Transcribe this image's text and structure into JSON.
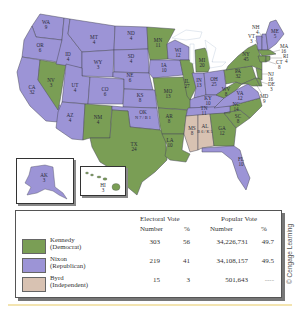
{
  "colors": {
    "kennedy": "#7a9e55",
    "nixon": "#9c94d6",
    "byrd": "#d8c2b2",
    "border": "#4a4a5a",
    "water": "#ffffff"
  },
  "states": {
    "WA": {
      "abbr": "WA",
      "ev": "9",
      "party": "nixon"
    },
    "OR": {
      "abbr": "OR",
      "ev": "6",
      "party": "nixon"
    },
    "CA": {
      "abbr": "CA",
      "ev": "32",
      "party": "nixon"
    },
    "NV": {
      "abbr": "NV",
      "ev": "3",
      "party": "kennedy"
    },
    "ID": {
      "abbr": "ID",
      "ev": "4",
      "party": "nixon"
    },
    "MT": {
      "abbr": "MT",
      "ev": "4",
      "party": "nixon"
    },
    "WY": {
      "abbr": "WY",
      "ev": "3",
      "party": "nixon"
    },
    "UT": {
      "abbr": "UT",
      "ev": "4",
      "party": "nixon"
    },
    "CO": {
      "abbr": "CO",
      "ev": "6",
      "party": "nixon"
    },
    "AZ": {
      "abbr": "AZ",
      "ev": "4",
      "party": "nixon"
    },
    "NM": {
      "abbr": "NM",
      "ev": "4",
      "party": "kennedy"
    },
    "ND": {
      "abbr": "ND",
      "ev": "4",
      "party": "nixon"
    },
    "SD": {
      "abbr": "SD",
      "ev": "4",
      "party": "nixon"
    },
    "NE": {
      "abbr": "NE",
      "ev": "6",
      "party": "nixon"
    },
    "KS": {
      "abbr": "KS",
      "ev": "8",
      "party": "nixon"
    },
    "OK": {
      "abbr": "OK",
      "ev": "N 7 / B 1",
      "party": "nixon"
    },
    "TX": {
      "abbr": "TX",
      "ev": "24",
      "party": "kennedy"
    },
    "MN": {
      "abbr": "MN",
      "ev": "11",
      "party": "kennedy"
    },
    "IA": {
      "abbr": "IA",
      "ev": "10",
      "party": "nixon"
    },
    "MO": {
      "abbr": "MO",
      "ev": "13",
      "party": "kennedy"
    },
    "AR": {
      "abbr": "AR",
      "ev": "8",
      "party": "kennedy"
    },
    "LA": {
      "abbr": "LA",
      "ev": "10",
      "party": "kennedy"
    },
    "WI": {
      "abbr": "WI",
      "ev": "12",
      "party": "nixon"
    },
    "IL": {
      "abbr": "IL",
      "ev": "27",
      "party": "kennedy"
    },
    "MI": {
      "abbr": "MI",
      "ev": "20",
      "party": "kennedy"
    },
    "IN": {
      "abbr": "IN",
      "ev": "13",
      "party": "nixon"
    },
    "OH": {
      "abbr": "OH",
      "ev": "25",
      "party": "nixon"
    },
    "KY": {
      "abbr": "KY",
      "ev": "10",
      "party": "nixon"
    },
    "TN": {
      "abbr": "TN",
      "ev": "11",
      "party": "nixon"
    },
    "MS": {
      "abbr": "MS",
      "ev": "8",
      "party": "byrd"
    },
    "AL": {
      "abbr": "AL",
      "ev": "B 6 / K 5",
      "party": "byrd"
    },
    "GA": {
      "abbr": "GA",
      "ev": "12",
      "party": "kennedy"
    },
    "FL": {
      "abbr": "FL",
      "ev": "10",
      "party": "nixon"
    },
    "SC": {
      "abbr": "SC",
      "ev": "8",
      "party": "kennedy"
    },
    "NC": {
      "abbr": "NC",
      "ev": "14",
      "party": "kennedy"
    },
    "VA": {
      "abbr": "VA",
      "ev": "12",
      "party": "nixon"
    },
    "WV": {
      "abbr": "WV",
      "ev": "8",
      "party": "kennedy"
    },
    "PA": {
      "abbr": "PA",
      "ev": "32",
      "party": "kennedy"
    },
    "NY": {
      "abbr": "NY",
      "ev": "45",
      "party": "kennedy"
    },
    "ME": {
      "abbr": "ME",
      "ev": "5",
      "party": "nixon"
    },
    "NH": {
      "abbr": "NH",
      "ev": "4",
      "party": "nixon"
    },
    "VT": {
      "abbr": "VT",
      "ev": "3",
      "party": "nixon"
    },
    "MA": {
      "abbr": "MA",
      "ev": "16",
      "party": "kennedy"
    },
    "RI": {
      "abbr": "RI",
      "ev": "4",
      "party": "kennedy"
    },
    "CT": {
      "abbr": "CT",
      "ev": "8",
      "party": "kennedy"
    },
    "NJ": {
      "abbr": "NJ",
      "ev": "16",
      "party": "kennedy"
    },
    "DE": {
      "abbr": "DE",
      "ev": "3",
      "party": "kennedy"
    },
    "MD": {
      "abbr": "MD",
      "ev": "9",
      "party": "kennedy"
    },
    "AK": {
      "abbr": "AK",
      "ev": "3",
      "party": "nixon"
    },
    "HI": {
      "abbr": "HI",
      "ev": "3",
      "party": "kennedy"
    }
  },
  "legend": {
    "header_electoral": "Electoral Vote",
    "header_popular": "Popular Vote",
    "sub_number": "Number",
    "sub_percent": "%",
    "rows": [
      {
        "name": "Kennedy",
        "party": "(Democrat)",
        "ev_number": "303",
        "ev_percent": "56",
        "pv_number": "34,226,731",
        "pv_percent": "49.7"
      },
      {
        "name": "Nixon",
        "party": "(Republican)",
        "ev_number": "219",
        "ev_percent": "41",
        "pv_number": "34,108,157",
        "pv_percent": "49.5"
      },
      {
        "name": "Byrd",
        "party": "(Independent)",
        "ev_number": "15",
        "ev_percent": "3",
        "pv_number": "501,643",
        "pv_percent": "----"
      }
    ]
  },
  "credit": "© Cengage Learning"
}
